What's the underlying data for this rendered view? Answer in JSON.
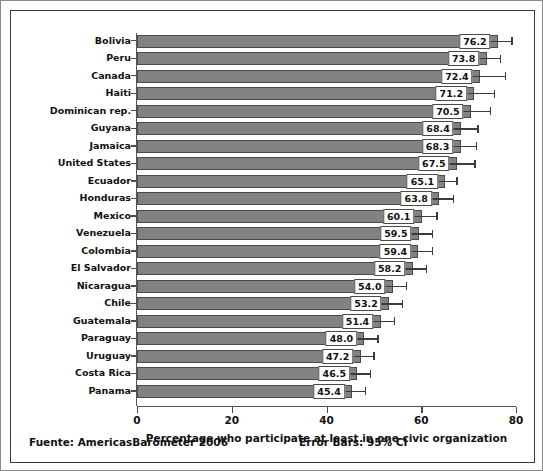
{
  "chart_data": {
    "type": "bar",
    "orientation": "horizontal",
    "title": "",
    "xlabel": "Percentage who participate at least in one civic organization",
    "ylabel": "",
    "xlim": [
      0,
      84
    ],
    "xticks": [
      0,
      20,
      40,
      60,
      80
    ],
    "xtick_labels": [
      "0",
      "20",
      "40",
      "60",
      "80"
    ],
    "grid": false,
    "legend": null,
    "bar_color": "#828282",
    "bar_edge_color": "#4a4a4a",
    "error_bar_color": "#3b3b3b",
    "error_bars": "95% CI",
    "categories": [
      "Bolivia",
      "Peru",
      "Canada",
      "Haiti",
      "Dominican rep.",
      "Guyana",
      "Jamaica",
      "United States",
      "Ecuador",
      "Honduras",
      "Mexico",
      "Venezuela",
      "Colombia",
      "El Salvador",
      "Nicaragua",
      "Chile",
      "Guatemala",
      "Paraguay",
      "Uruguay",
      "Costa Rica",
      "Panama"
    ],
    "values": [
      76.2,
      73.8,
      72.4,
      71.2,
      70.5,
      68.4,
      68.3,
      67.5,
      65.1,
      63.8,
      60.1,
      59.5,
      59.4,
      58.2,
      54.0,
      53.2,
      51.4,
      48.0,
      47.2,
      46.5,
      45.4
    ],
    "value_labels": [
      "76.2",
      "73.8",
      "72.4",
      "71.2",
      "70.5",
      "68.4",
      "68.3",
      "67.5",
      "65.1",
      "63.8",
      "60.1",
      "59.5",
      "59.4",
      "58.2",
      "54.0",
      "53.2",
      "51.4",
      "48.0",
      "47.2",
      "46.5",
      "45.4"
    ],
    "error_low": [
      73.4,
      71.0,
      67.2,
      67.1,
      66.5,
      65.0,
      65.1,
      63.8,
      62.8,
      61.0,
      57.0,
      56.8,
      56.6,
      55.5,
      51.2,
      50.5,
      48.6,
      45.3,
      44.5,
      43.8,
      42.7
    ],
    "error_high": [
      79.0,
      76.6,
      77.6,
      75.3,
      74.5,
      71.8,
      71.5,
      71.2,
      67.4,
      66.6,
      63.2,
      62.2,
      62.2,
      60.9,
      56.8,
      55.9,
      54.2,
      50.7,
      49.9,
      49.2,
      48.1
    ]
  },
  "axis": {
    "x_title": "Percentage who participate at least in one civic organization"
  },
  "footer": {
    "source": "Fuente: AmericasBarometer 2006",
    "error_bars_note": "Error Bars: 95% CI"
  }
}
